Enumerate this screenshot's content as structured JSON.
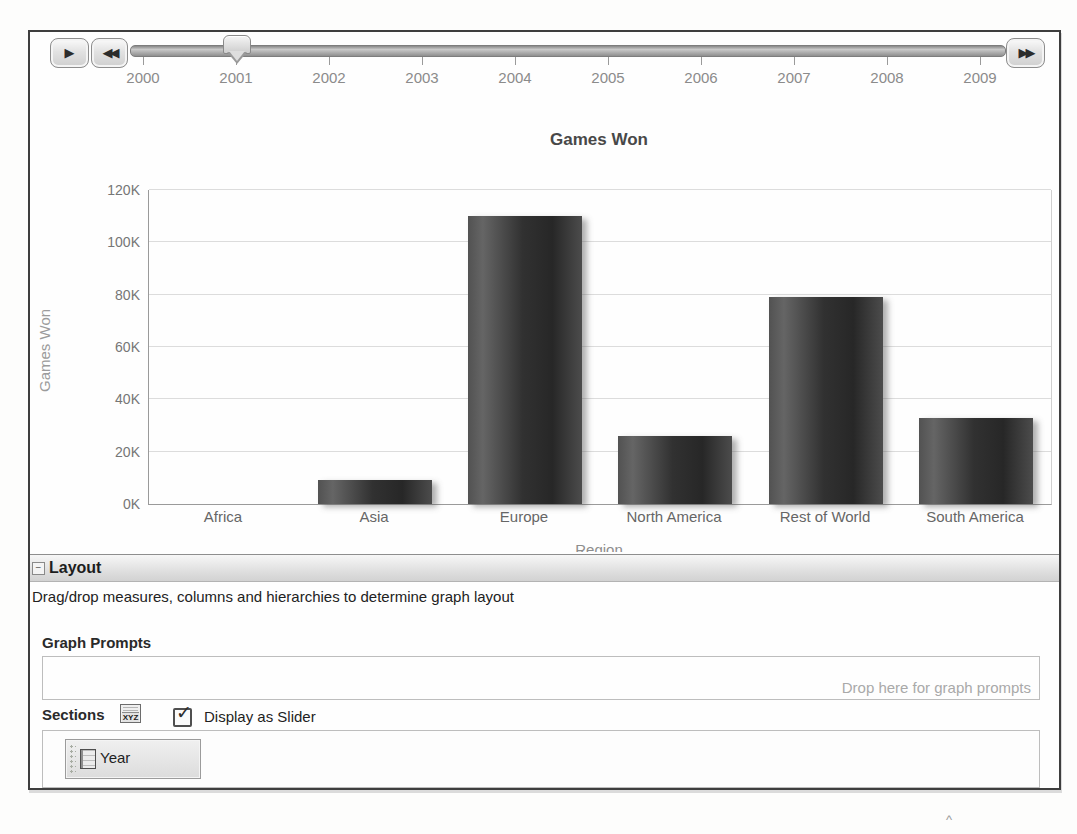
{
  "scan_artifacts": {
    "top_strip": ", . ‚ . ,",
    "bottom_mark": "^"
  },
  "slider": {
    "play_icon": "▶",
    "rewind_icon": "◀◀",
    "forward_icon": "▶▶",
    "years": [
      "2000",
      "2001",
      "2002",
      "2003",
      "2004",
      "2005",
      "2006",
      "2007",
      "2008",
      "2009"
    ],
    "selected_year": "2001"
  },
  "chart_data": {
    "type": "bar",
    "title": "Games Won",
    "xlabel": "Region",
    "ylabel": "Games Won",
    "categories": [
      "Africa",
      "Asia",
      "Europe",
      "North America",
      "Rest of World",
      "South America"
    ],
    "values": [
      0,
      9000,
      110000,
      26000,
      79000,
      33000
    ],
    "ylim": [
      0,
      120000
    ],
    "ytick_labels": [
      "0K",
      "20K",
      "40K",
      "60K",
      "80K",
      "100K",
      "120K"
    ],
    "grid": true,
    "legend": "none",
    "bar_color": "#383838"
  },
  "layout_panel": {
    "collapse_icon": "−",
    "title": "Layout",
    "description": "Drag/drop measures, columns and hierarchies to determine graph layout",
    "graph_prompts": {
      "label": "Graph Prompts",
      "placeholder": "Drop here for graph prompts"
    },
    "sections": {
      "label": "Sections",
      "icon_text": "XYZ",
      "checkbox_label": "Display as Slider",
      "checkbox_checked": true,
      "checkbox_mark": "✓",
      "items": [
        {
          "label": "Year"
        }
      ]
    }
  }
}
